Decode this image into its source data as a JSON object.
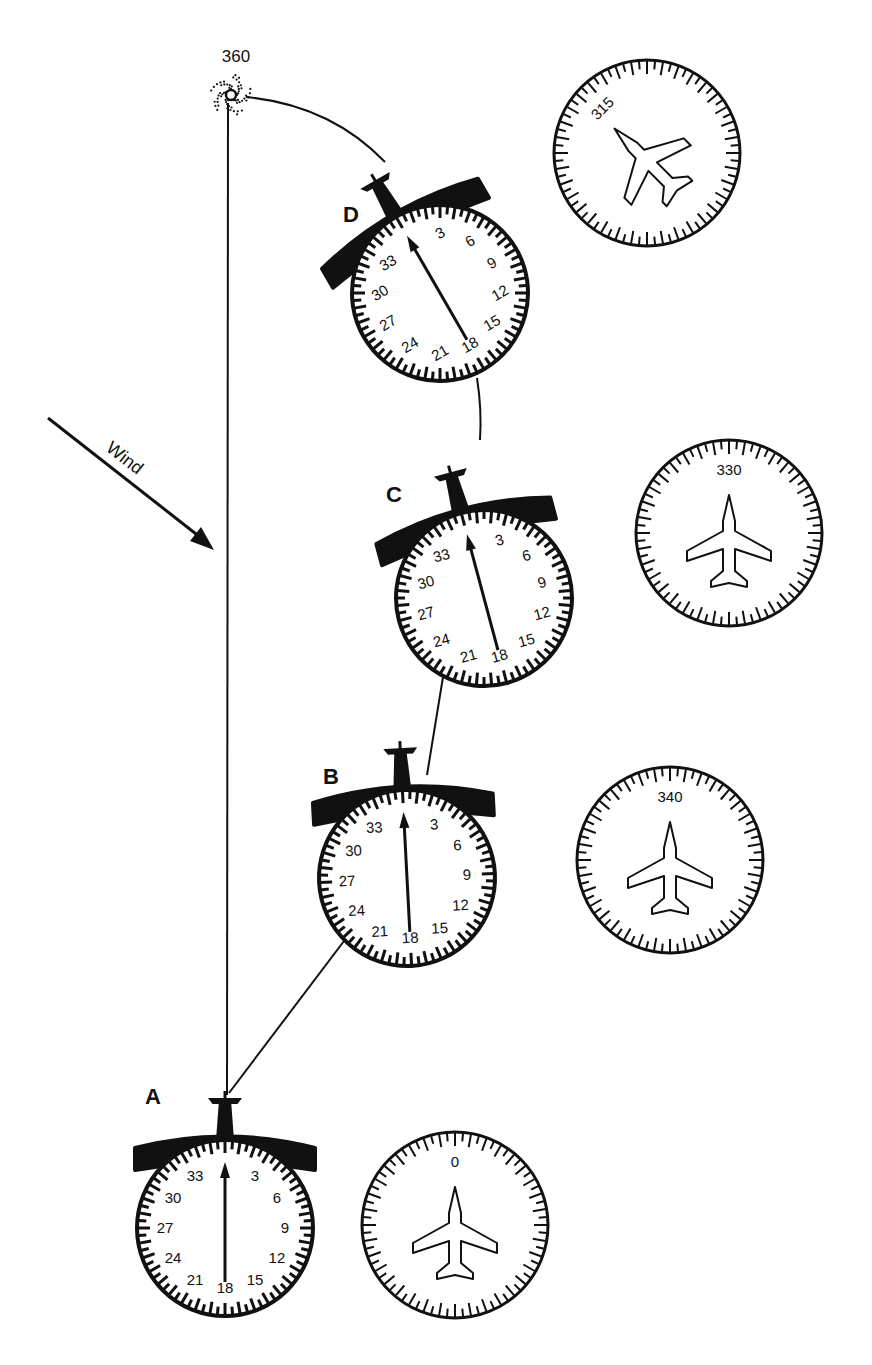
{
  "diagram": {
    "title": "",
    "station": {
      "label": "360",
      "icon": "ndb-station-icon"
    },
    "wind": {
      "label": "Wind",
      "icon": "wind-arrow-icon"
    },
    "adf_scale_labels": [
      "3",
      "6",
      "9",
      "12",
      "15",
      "18",
      "21",
      "24",
      "27",
      "30",
      "33"
    ],
    "positions": [
      {
        "id": "A",
        "label": "A",
        "adf_relative_bearing": 0,
        "heading_label": "0",
        "heading": 0
      },
      {
        "id": "B",
        "label": "B",
        "adf_relative_bearing": 0,
        "heading_label": "340",
        "heading": 340
      },
      {
        "id": "C",
        "label": "C",
        "adf_relative_bearing": 0,
        "heading_label": "330",
        "heading": 330
      },
      {
        "id": "D",
        "label": "D",
        "adf_relative_bearing": 0,
        "heading_label": "315",
        "heading": 315
      }
    ],
    "colors": {
      "ink": "#111111",
      "background": "#ffffff"
    }
  }
}
